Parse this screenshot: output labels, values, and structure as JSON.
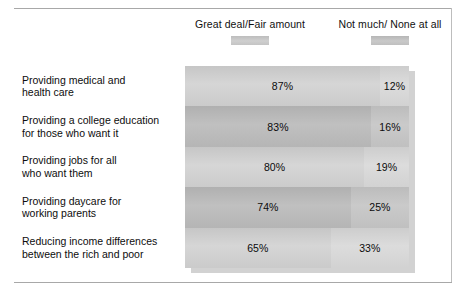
{
  "legend": {
    "entries": [
      {
        "label": "Great deal/Fair amount",
        "swatch": "legend-swatch-great-deal"
      },
      {
        "label": "Not much/ None at all",
        "swatch": "legend-swatch-not-much"
      }
    ]
  },
  "colors": {
    "series_great_deal": "#cbcbcb",
    "series_not_much": "#d4d4d4",
    "row_alt_dark": "#b8b8b8",
    "text": "#0d0d0d",
    "frame_rule": "#a8a8a8",
    "bar_shadow": "#d2d2d2"
  },
  "chart_data": {
    "type": "bar",
    "title": "",
    "subtitle": "",
    "xlabel": "",
    "ylabel": "",
    "orientation": "horizontal",
    "stacked": true,
    "stack_mode": "percent",
    "grid": false,
    "legend_position": "top",
    "xlim": [
      0,
      100
    ],
    "value_suffix": "%",
    "categories": [
      "Providing medical and health care",
      "Providing a college education for those who want it",
      "Providing jobs for all who want them",
      "Providing daycare for working parents",
      "Reducing income differences between the rich and poor"
    ],
    "category_lines": [
      [
        "Providing medical and",
        "health care"
      ],
      [
        "Providing a college education",
        "for those who want it"
      ],
      [
        "Providing jobs for all",
        "who want them"
      ],
      [
        "Providing daycare for",
        "working parents"
      ],
      [
        "Reducing income differences",
        "between the rich and poor"
      ]
    ],
    "series": [
      {
        "name": "Great deal/Fair amount",
        "values": [
          87,
          83,
          80,
          74,
          65
        ],
        "labels": [
          "87%",
          "83%",
          "80%",
          "74%",
          "65%"
        ]
      },
      {
        "name": "Not much/ None at all",
        "values": [
          12,
          16,
          19,
          25,
          33
        ],
        "labels": [
          "12%",
          "16%",
          "19%",
          "25%",
          "33%"
        ]
      }
    ]
  }
}
